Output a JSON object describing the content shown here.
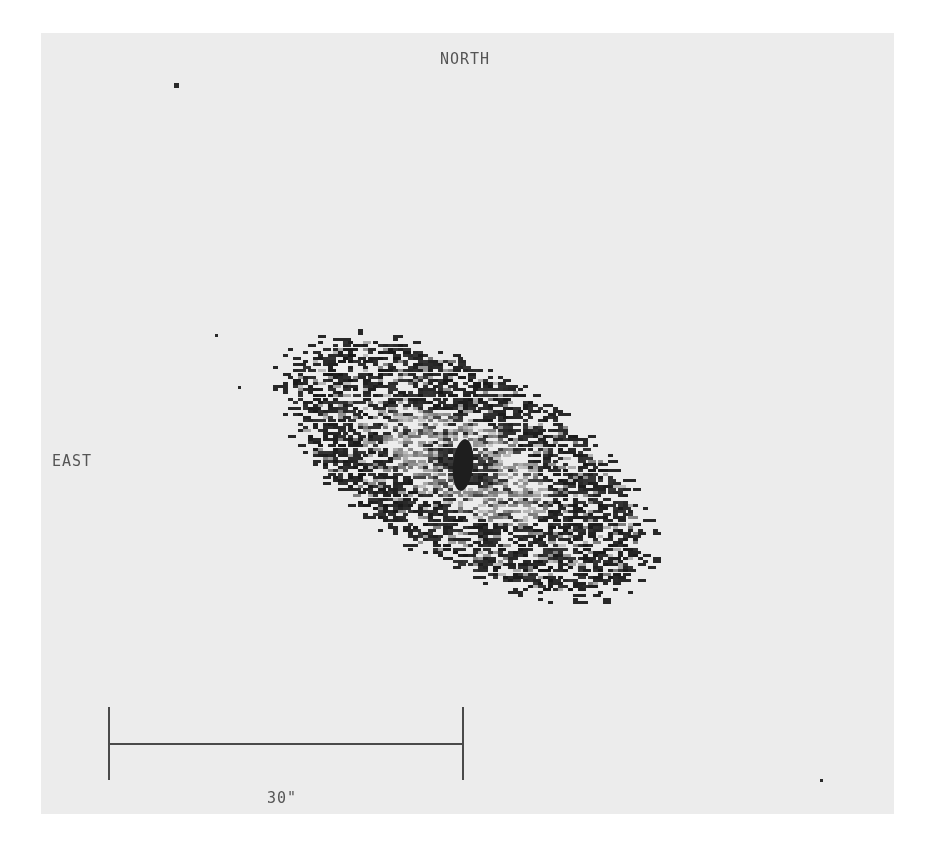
{
  "image": {
    "description": "Grayscale astronomical image of an inclined spiral galaxy with orientation labels and angular scale bar",
    "background_color": "#ececec",
    "page_color": "#ffffff"
  },
  "orientation": {
    "north_label": "NORTH",
    "east_label": "EAST"
  },
  "scale_bar": {
    "label": "30\"",
    "length_arcsec": 30
  },
  "galaxy": {
    "center": [
      422,
      432
    ],
    "semi_major": 205,
    "semi_minor": 95,
    "position_angle_deg": 30,
    "core_color": "#1e1e1e",
    "halo_color": "#8a8a8a",
    "knot_color": "#202020"
  },
  "stars": [
    {
      "x": 133,
      "y": 50,
      "size": 5
    },
    {
      "x": 174,
      "y": 301,
      "size": 3
    },
    {
      "x": 197,
      "y": 353,
      "size": 3
    },
    {
      "x": 779,
      "y": 746,
      "size": 3
    }
  ]
}
